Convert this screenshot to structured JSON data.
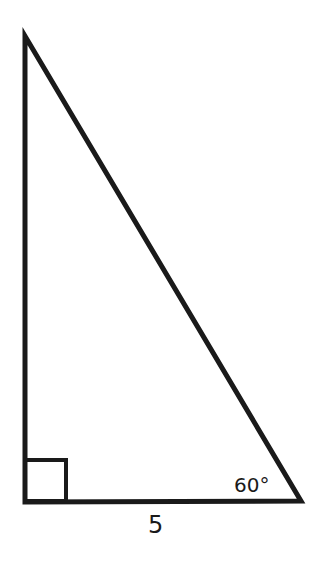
{
  "diagram": {
    "type": "right-triangle",
    "vertices": {
      "top": [
        25,
        36
      ],
      "bottom_left": [
        25,
        502
      ],
      "bottom_right": [
        301,
        500
      ]
    },
    "right_angle_marker": {
      "x": 25,
      "y": 460,
      "size": 41
    },
    "angle_label": "60°",
    "side_label": "5",
    "stroke_color": "#1a1a1a",
    "background": "#ffffff"
  }
}
